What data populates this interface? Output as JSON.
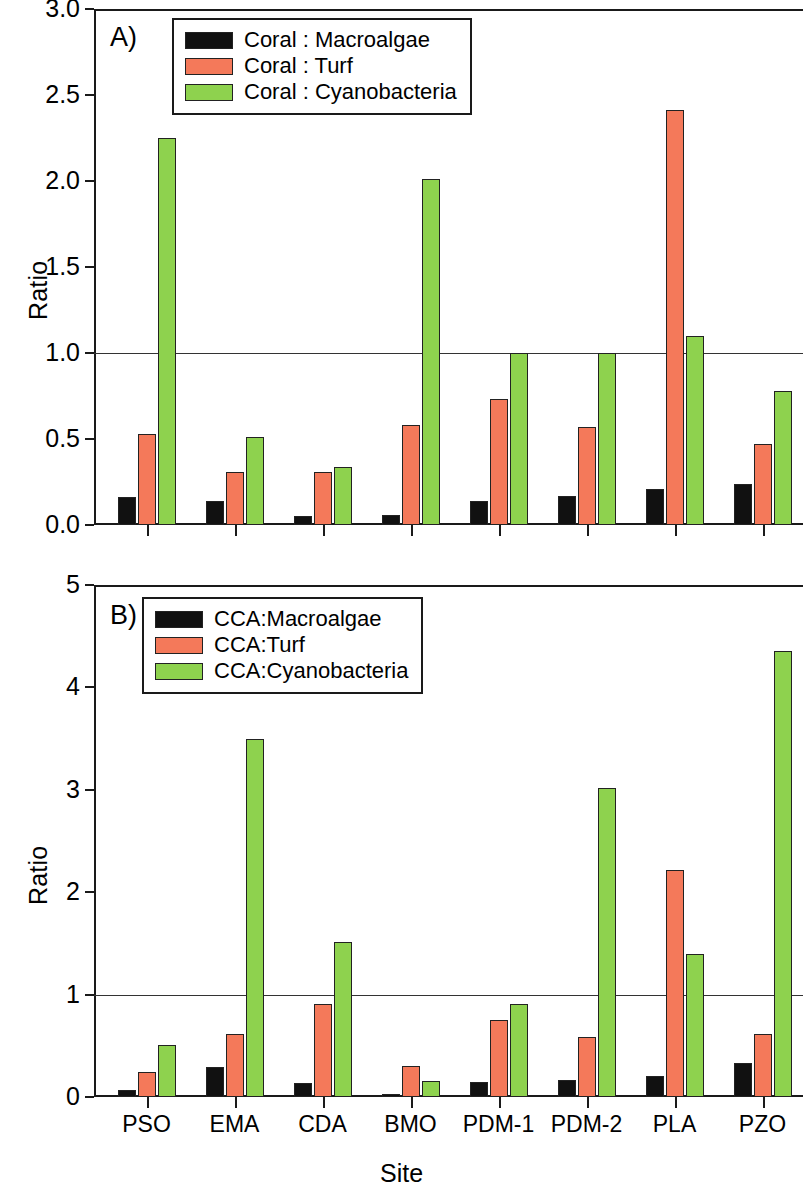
{
  "figure": {
    "axis_title_x": "Site",
    "axis_title_y": "Ratio",
    "colors": {
      "macroalgae": "#111111",
      "turf": "#f4795a",
      "cyanobacteria": "#8ed24e",
      "axis": "#1a1a1a",
      "reference_line": "#333333",
      "background": "#ffffff"
    }
  },
  "panels": [
    {
      "letter": "A)",
      "legend": [
        "Coral : Macroalgae",
        "Coral : Turf",
        "Coral : Cyanobacteria"
      ],
      "yticks": [
        "0.0",
        "0.5",
        "1.0",
        "1.5",
        "2.0",
        "2.5",
        "3.0"
      ]
    },
    {
      "letter": "B)",
      "legend": [
        "CCA:Macroalgae",
        "CCA:Turf",
        "CCA:Cyanobacteria"
      ],
      "yticks": [
        "0",
        "1",
        "2",
        "3",
        "4",
        "5"
      ]
    }
  ],
  "xlabels": [
    "PSO",
    "EMA",
    "CDA",
    "BMO",
    "PDM-1",
    "PDM-2",
    "PLA",
    "PZO"
  ],
  "chart_data": [
    {
      "type": "bar",
      "panel": "A)",
      "title": "",
      "xlabel": "Site",
      "ylabel": "Ratio",
      "ylim": [
        0.0,
        3.0
      ],
      "ytick_values": [
        0.0,
        0.5,
        1.0,
        1.5,
        2.0,
        2.5,
        3.0
      ],
      "grid": false,
      "reference_line_y": 1.0,
      "legend_position": "top-center",
      "categories": [
        "PSO",
        "EMA",
        "CDA",
        "BMO",
        "PDM-1",
        "PDM-2",
        "PLA",
        "PZO"
      ],
      "series": [
        {
          "name": "Coral : Macroalgae",
          "color": "#111111",
          "values": [
            0.16,
            0.14,
            0.05,
            0.06,
            0.14,
            0.17,
            0.21,
            0.24
          ]
        },
        {
          "name": "Coral : Turf",
          "color": "#f4795a",
          "values": [
            0.53,
            0.31,
            0.31,
            0.58,
            0.73,
            0.57,
            2.41,
            0.47
          ]
        },
        {
          "name": "Coral : Cyanobacteria",
          "color": "#8ed24e",
          "values": [
            2.25,
            0.51,
            0.34,
            2.01,
            1.0,
            1.0,
            1.1,
            0.78
          ]
        }
      ]
    },
    {
      "type": "bar",
      "panel": "B)",
      "title": "",
      "xlabel": "Site",
      "ylabel": "Ratio",
      "ylim": [
        0,
        5
      ],
      "ytick_values": [
        0,
        1,
        2,
        3,
        4,
        5
      ],
      "grid": false,
      "reference_line_y": 1.0,
      "legend_position": "top-center",
      "categories": [
        "PSO",
        "EMA",
        "CDA",
        "BMO",
        "PDM-1",
        "PDM-2",
        "PLA",
        "PZO"
      ],
      "series": [
        {
          "name": "CCA:Macroalgae",
          "color": "#111111",
          "values": [
            0.07,
            0.29,
            0.14,
            0.03,
            0.15,
            0.17,
            0.21,
            0.33
          ]
        },
        {
          "name": "CCA:Turf",
          "color": "#f4795a",
          "values": [
            0.24,
            0.62,
            0.91,
            0.3,
            0.75,
            0.59,
            2.22,
            0.62
          ]
        },
        {
          "name": "CCA:Cyanobacteria",
          "color": "#8ed24e",
          "values": [
            0.51,
            3.5,
            1.51,
            0.16,
            0.91,
            3.02,
            1.4,
            4.36
          ]
        }
      ]
    }
  ]
}
